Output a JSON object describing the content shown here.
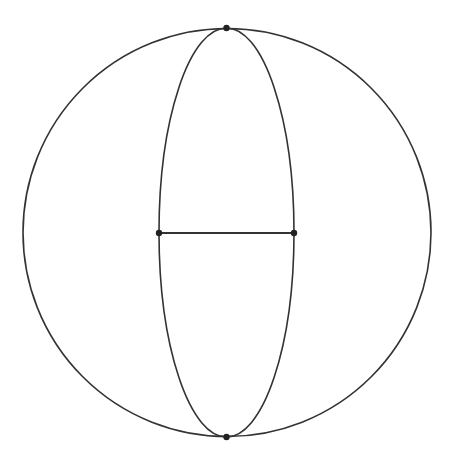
{
  "diagram": {
    "type": "graph-on-sphere",
    "colors": {
      "stroke": "#333333",
      "vertex": "#222222",
      "background": "#ffffff"
    },
    "outer_circle": {
      "cx": 227,
      "cy": 232.5,
      "r": 204
    },
    "inner_ellipse": {
      "cx": 226.5,
      "cy": 232.5,
      "rx": 67.5,
      "ry": 204.5
    },
    "vertices": [
      {
        "id": "top",
        "x": 226.5,
        "y": 28
      },
      {
        "id": "bottom",
        "x": 226.5,
        "y": 437
      },
      {
        "id": "left",
        "x": 159,
        "y": 233
      },
      {
        "id": "right",
        "x": 294,
        "y": 233
      }
    ],
    "edges": [
      {
        "from": "left",
        "to": "right",
        "kind": "segment"
      }
    ]
  }
}
